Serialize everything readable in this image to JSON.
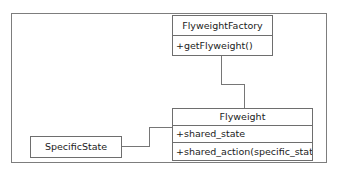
{
  "diagram": {
    "type": "uml-class-diagram",
    "colors": {
      "frame_border": "#7d7d7d",
      "box_border": "#6e6e6e",
      "connector": "#767676",
      "text": "#1b1b1b",
      "background": "#ffffff"
    },
    "classes": [
      {
        "id": "flyweight-factory",
        "name": "FlyweightFactory",
        "attributes": [],
        "operations": [
          "+getFlyweight()"
        ]
      },
      {
        "id": "flyweight",
        "name": "Flyweight",
        "attributes": [
          "+shared_state"
        ],
        "operations": [
          "+shared_action(specific_state)"
        ]
      },
      {
        "id": "specific-state",
        "name": "SpecificState",
        "attributes": [],
        "operations": []
      }
    ],
    "relationships": [
      {
        "id": "factory-to-flyweight",
        "from": "flyweight-factory",
        "to": "flyweight",
        "style": "orthogonal-elbow"
      },
      {
        "id": "specificstate-to-flyweight",
        "from": "specific-state",
        "to": "flyweight",
        "style": "orthogonal-elbow"
      }
    ]
  }
}
